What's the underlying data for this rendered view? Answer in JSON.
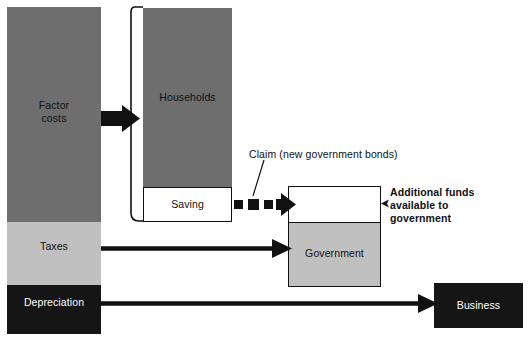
{
  "diagram": {
    "background": "#ffffff"
  },
  "colors": {
    "dark_gray": "#6e6e6e",
    "light_gray": "#c0c0c0",
    "black": "#151515",
    "white": "#ffffff",
    "stroke": "#111111",
    "text": "#111111",
    "text_inverse": "#ffffff"
  },
  "left_column": {
    "name": "national-income-column",
    "segments": [
      {
        "id": "factor-costs",
        "label": "Factor\ncosts",
        "label_line1": "Factor",
        "label_line2": "costs",
        "fill": "#6e6e6e",
        "text_color": "#111111"
      },
      {
        "id": "taxes",
        "label": "Taxes",
        "fill": "#c0c0c0",
        "text_color": "#111111"
      },
      {
        "id": "depreciation",
        "label": "Depreciation",
        "fill": "#151515",
        "text_color": "#ffffff"
      }
    ]
  },
  "households_bracket": {
    "name": "households-bracket",
    "segments": [
      {
        "id": "households",
        "label": "Households",
        "fill": "#6e6e6e",
        "text_color": "#111111"
      },
      {
        "id": "saving",
        "label": "Saving",
        "fill": "#ffffff",
        "text_color": "#111111"
      }
    ]
  },
  "government_box": {
    "name": "government-box",
    "segments": [
      {
        "id": "additional-funds",
        "label": "",
        "fill": "#ffffff"
      },
      {
        "id": "government",
        "label": "Government",
        "fill": "#c0c0c0",
        "text_color": "#111111"
      }
    ]
  },
  "business_box": {
    "name": "business-box",
    "label": "Business",
    "fill": "#151515",
    "text_color": "#ffffff"
  },
  "annotations": {
    "claim": {
      "name": "claim-annotation",
      "text": "Claim (new government bonds)",
      "bold": false
    },
    "additional_funds": {
      "name": "additional-funds-annotation",
      "line1": "Additional funds",
      "line2": "available to",
      "line3": "government",
      "bold": true
    }
  },
  "flows": [
    {
      "id": "factor-costs-to-households",
      "style": "thick-block-arrow",
      "from": "factor-costs",
      "to": "households"
    },
    {
      "id": "saving-to-government-claim",
      "style": "dashed-block-arrow",
      "from": "saving",
      "to": "additional-funds"
    },
    {
      "id": "taxes-to-government",
      "style": "thin-line-arrow",
      "from": "taxes",
      "to": "government"
    },
    {
      "id": "depreciation-to-business",
      "style": "thin-line-arrow",
      "from": "depreciation",
      "to": "business"
    }
  ]
}
